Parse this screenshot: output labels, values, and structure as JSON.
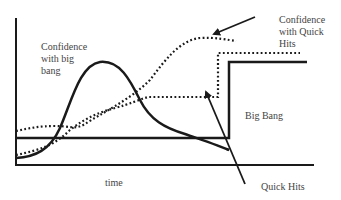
{
  "diagram": {
    "labels": {
      "confidence_big_bang": "Confidence\nwith big\nbang",
      "confidence_quick_hits": "Confidence\nwith Quick\nHits",
      "big_bang": "Big Bang",
      "quick_hits": "Quick Hits",
      "x_axis": "time"
    },
    "series": [
      {
        "name": "Big Bang",
        "style": "solid step"
      },
      {
        "name": "Quick Hits",
        "style": "dotted step"
      },
      {
        "name": "Confidence with big bang",
        "style": "solid curve"
      },
      {
        "name": "Confidence with Quick Hits",
        "style": "dotted curve"
      }
    ],
    "colors": {
      "line": "#1a1a1a",
      "text": "#444444",
      "background": "#ffffff"
    }
  }
}
